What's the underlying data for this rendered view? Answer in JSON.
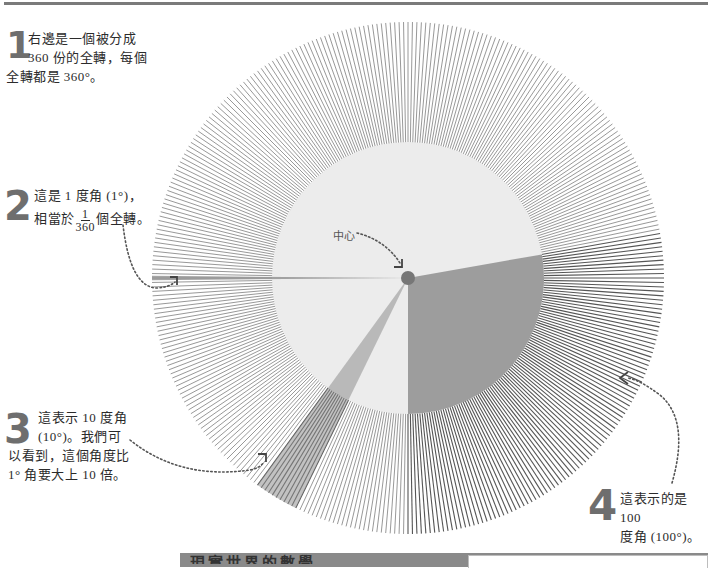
{
  "diagram": {
    "center": {
      "x": 408,
      "y": 278
    },
    "outer_radius": 256,
    "inner_radius": 136,
    "divisions": 360,
    "center_label": "中心",
    "wedges": [
      {
        "id": "one-degree",
        "start_deg": 179.5,
        "end_deg": 180.5,
        "degrees": 1
      },
      {
        "id": "ten-degree",
        "start_deg": 116,
        "end_deg": 126,
        "degrees": 10
      },
      {
        "id": "hundred-degree",
        "start_deg": -10,
        "end_deg": 90,
        "degrees": 100
      }
    ],
    "colors": {
      "ray": "#8c8c8c",
      "ray_dark": "#555555",
      "inner_fill": "#ececec",
      "wedge_fill": "#8f8f8f",
      "dot": "#777777",
      "text": "#2b2b2b",
      "number": "#6e6e6e"
    }
  },
  "notes": {
    "n1": {
      "number": "1",
      "line1": "右邊是一個被分成",
      "line2": "360 份的全轉，每個",
      "line3": "全轉都是 360°。"
    },
    "n2": {
      "number": "2",
      "line1": "這是 1 度角 (1°)，",
      "line2_pre": "相當於",
      "frac_num": "1",
      "frac_den": "360",
      "line2_post": "個全轉。"
    },
    "n3": {
      "number": "3",
      "line1": "這表示 10 度角",
      "line2": "(10°)。我們可",
      "line3": "以看到，這個角度比",
      "line4": "1° 角要大上 10 倍。"
    },
    "n4": {
      "number": "4",
      "line1": "這表示的是 100",
      "line2": "度角 (100°)。"
    }
  },
  "banner": {
    "title": "現實世界的數學"
  }
}
